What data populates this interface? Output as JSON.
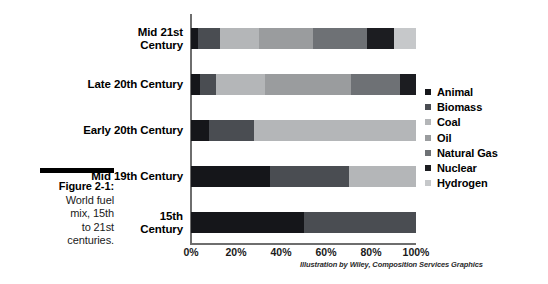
{
  "caption": {
    "title": "Figure 2-1:",
    "lines": [
      "World fuel",
      "mix, 15th",
      "to 21st",
      "centuries."
    ]
  },
  "credit": "Illustration by Wiley, Composition Services Graphics",
  "chart_data": {
    "type": "bar",
    "orientation": "horizontal",
    "stacked": true,
    "normalized_percent": true,
    "title": "",
    "xlabel": "",
    "ylabel": "",
    "xlim": [
      0,
      100
    ],
    "grid": false,
    "legend_position": "right",
    "categories": [
      "Mid 21st Century",
      "Late 20th Century",
      "Early 20th Century",
      "Mid 19th Century",
      "15th Century"
    ],
    "category_label_lines": [
      [
        "Mid 21st",
        "Century"
      ],
      [
        "Late 20th Century"
      ],
      [
        "Early 20th Century"
      ],
      [
        "Mid 19th Century"
      ],
      [
        "15th",
        "Century"
      ]
    ],
    "xticks": [
      0,
      20,
      40,
      60,
      80,
      100
    ],
    "xticklabels": [
      "0%",
      "20%",
      "40%",
      "60%",
      "80%",
      "100%"
    ],
    "series": [
      {
        "name": "Animal",
        "color": "#15161a",
        "values": [
          3,
          4,
          8,
          35,
          50
        ]
      },
      {
        "name": "Biomass",
        "color": "#4a4d52",
        "values": [
          10,
          7,
          20,
          35,
          50
        ]
      },
      {
        "name": "Coal",
        "color": "#b4b6b8",
        "values": [
          17,
          22,
          72,
          30,
          0
        ]
      },
      {
        "name": "Oil",
        "color": "#9a9c9e",
        "values": [
          24,
          38,
          0,
          0,
          0
        ]
      },
      {
        "name": "Natural Gas",
        "color": "#6e7175",
        "values": [
          24,
          22,
          0,
          0,
          0
        ]
      },
      {
        "name": "Nuclear",
        "color": "#1c1d21",
        "values": [
          12,
          7,
          0,
          0,
          0
        ]
      },
      {
        "name": "Hydrogen",
        "color": "#c6c8ca",
        "values": [
          10,
          0,
          0,
          0,
          0
        ]
      }
    ]
  }
}
